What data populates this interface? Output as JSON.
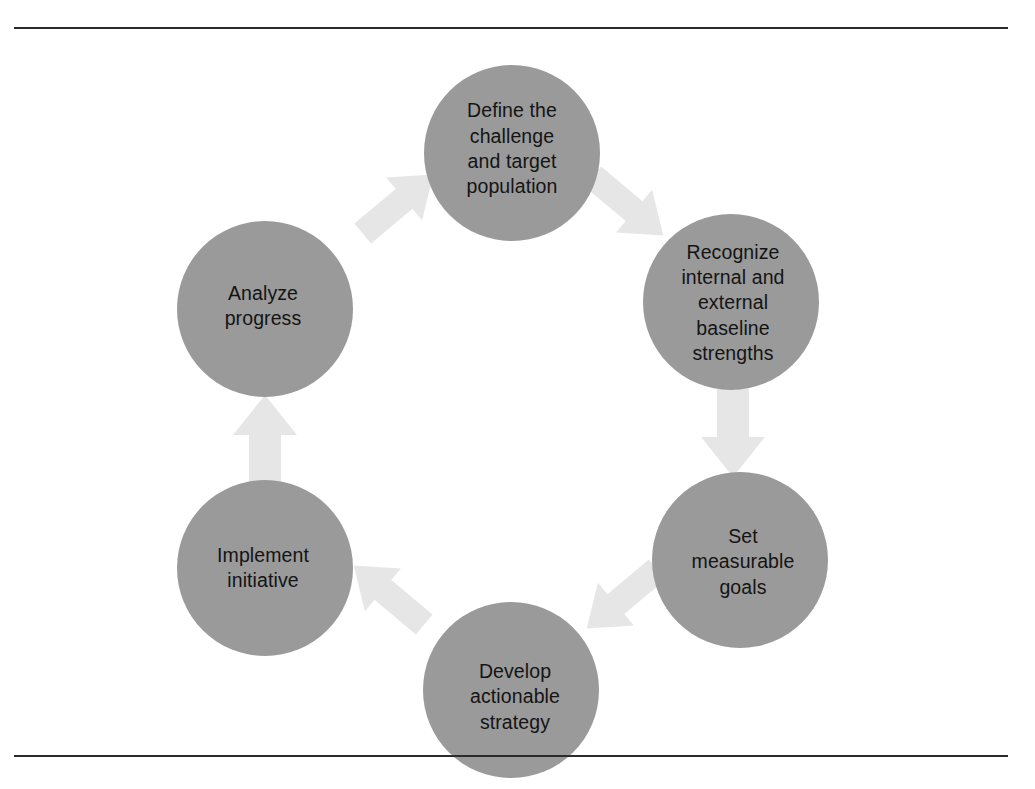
{
  "figure": {
    "type": "cyclical-process-diagram",
    "direction": "clockwise",
    "node_count": 6,
    "arrow_count": 6
  },
  "colors": {
    "node_fill": "#9a9a9a",
    "node_text": "#141414",
    "arrow_fill": "#e6e6e6",
    "rule": "#2b2b2b",
    "background": "#ffffff"
  },
  "nodes": [
    {
      "id": "define",
      "order": 1,
      "label": "Define the\nchallenge\nand target\npopulation"
    },
    {
      "id": "recognize",
      "order": 2,
      "label": "Recognize\ninternal and\nexternal\nbaseline\nstrengths"
    },
    {
      "id": "goals",
      "order": 3,
      "label": "Set\nmeasurable\ngoals"
    },
    {
      "id": "strategy",
      "order": 4,
      "label": "Develop\nactionable\nstrategy"
    },
    {
      "id": "implement",
      "order": 5,
      "label": "Implement\ninitiative"
    },
    {
      "id": "analyze",
      "order": 6,
      "label": "Analyze\nprogress"
    }
  ],
  "arrows": [
    {
      "id": "define-to-recognize",
      "from": "define",
      "to": "recognize",
      "direction": "down-right"
    },
    {
      "id": "recognize-to-goals",
      "from": "recognize",
      "to": "goals",
      "direction": "down"
    },
    {
      "id": "goals-to-strategy",
      "from": "goals",
      "to": "strategy",
      "direction": "down-left"
    },
    {
      "id": "strategy-to-implement",
      "from": "strategy",
      "to": "implement",
      "direction": "up-left"
    },
    {
      "id": "implement-to-analyze",
      "from": "implement",
      "to": "analyze",
      "direction": "up"
    },
    {
      "id": "analyze-to-define",
      "from": "analyze",
      "to": "define",
      "direction": "up-right"
    }
  ]
}
